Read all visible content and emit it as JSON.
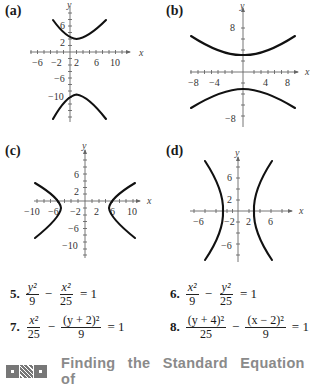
{
  "graphs": [
    {
      "label": "(a)",
      "x_axis_label": "x",
      "y_axis_label": "y",
      "x_ticks": [
        "−6",
        "−2",
        "2",
        "6",
        "10"
      ],
      "y_ticks": [
        "6",
        "2",
        "−6",
        "−10"
      ],
      "description": "Vertical hyperbola opening up/down, center (2,-4)"
    },
    {
      "label": "(b)",
      "x_axis_label": "x",
      "y_axis_label": "y",
      "x_ticks": [
        "−8",
        "−4",
        "4",
        "8"
      ],
      "y_ticks": [
        "8",
        "−8"
      ],
      "description": "Vertical hyperbola opening up/down, center (0,0)"
    },
    {
      "label": "(c)",
      "x_axis_label": "x",
      "y_axis_label": "y",
      "x_ticks": [
        "−10",
        "−6",
        "−2",
        "2",
        "6",
        "10"
      ],
      "y_ticks": [
        "6",
        "2",
        "−6",
        "−10"
      ],
      "description": "Horizontal hyperbola opening left/right, center (0,-2)"
    },
    {
      "label": "(d)",
      "x_axis_label": "x",
      "y_axis_label": "y",
      "x_ticks": [
        "−6",
        "−2",
        "2",
        "6"
      ],
      "y_ticks": [
        "6",
        "2",
        "−6"
      ],
      "description": "Horizontal hyperbola opening left/right, center (0,0)"
    }
  ],
  "exercises": [
    {
      "number": "5.",
      "term1_num": "y²",
      "term1_den": "9",
      "op": "−",
      "term2_num": "x²",
      "term2_den": "25",
      "rhs": "= 1"
    },
    {
      "number": "6.",
      "term1_num": "x²",
      "term1_den": "9",
      "op": "−",
      "term2_num": "y²",
      "term2_den": "25",
      "rhs": "= 1"
    },
    {
      "number": "7.",
      "term1_num": "x²",
      "term1_den": "25",
      "op": "−",
      "term2_num": "(y + 2)²",
      "term2_den": "9",
      "rhs": "= 1"
    },
    {
      "number": "8.",
      "term1_num": "(y + 4)²",
      "term1_den": "25",
      "op": "−",
      "term2_num": "(x − 2)²",
      "term2_den": "9",
      "rhs": "= 1"
    }
  ],
  "section_heading": {
    "icon": "qr-code-icon",
    "text": "Finding the Standard Equation of"
  }
}
